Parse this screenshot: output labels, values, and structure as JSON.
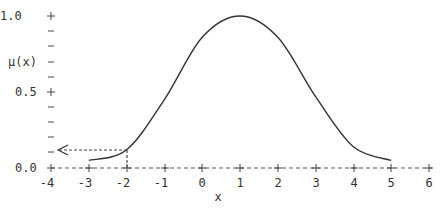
{
  "chart_data": {
    "type": "line",
    "title": "",
    "xlabel": "x",
    "ylabel": "μ(x)",
    "xlim": [
      -4,
      6
    ],
    "ylim": [
      0.0,
      1.0
    ],
    "x_ticks": [
      "-4",
      "-3",
      "-2",
      "-1",
      "0",
      "1",
      "2",
      "3",
      "4",
      "5",
      "6"
    ],
    "y_ticks": [
      "0.0",
      "0.5",
      "1.0"
    ],
    "y_minor_tick_step": 0.1,
    "grid": false,
    "legend": null,
    "series": [
      {
        "name": "μ(x)",
        "x": [
          -3,
          -2,
          -1,
          0,
          1,
          2,
          3,
          4,
          5
        ],
        "values": [
          0.05,
          0.12,
          0.45,
          0.86,
          1.0,
          0.86,
          0.47,
          0.14,
          0.05
        ]
      }
    ],
    "annotations": [
      {
        "type": "dashed-arrow",
        "description": "vertical dashed line from x=-2 up to curve, then horizontal dashed arrow left to y-axis",
        "x": -2,
        "y": 0.12
      }
    ]
  },
  "labels": {
    "xlabel": "x",
    "ylabel": "μ(x)",
    "y_tick_10": "1.0",
    "y_tick_05": "0.5",
    "y_tick_00": "0.0",
    "x_ticks": [
      "-4",
      "-3",
      "-2",
      "-1",
      "0",
      "1",
      "2",
      "3",
      "4",
      "5",
      "6"
    ]
  }
}
